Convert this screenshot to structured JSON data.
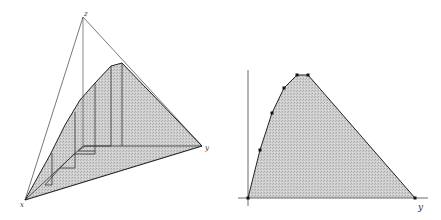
{
  "figure": {
    "left_panel": {
      "description": "3D simplex with shaded region and staircase projection lines",
      "labels": {
        "apex_top": "z",
        "bottom_left": "x",
        "right": "y"
      },
      "fill_color": "#c8c8c8",
      "line_color": "#222222"
    },
    "right_panel": {
      "description": "2D cross-section: shaded polygon above horizontal axis",
      "axis_label_x": "y",
      "fill_color": "#c8c8c8",
      "line_color": "#222222",
      "vertices": [
        [
          248,
          198
        ],
        [
          260,
          150
        ],
        [
          272,
          113
        ],
        [
          284,
          88
        ],
        [
          297,
          75
        ],
        [
          308,
          75
        ],
        [
          415,
          198
        ]
      ],
      "marked_points": [
        [
          248,
          198
        ],
        [
          260,
          150
        ],
        [
          272,
          113
        ],
        [
          284,
          88
        ],
        [
          297,
          75
        ],
        [
          308,
          75
        ],
        [
          415,
          198
        ]
      ]
    }
  }
}
